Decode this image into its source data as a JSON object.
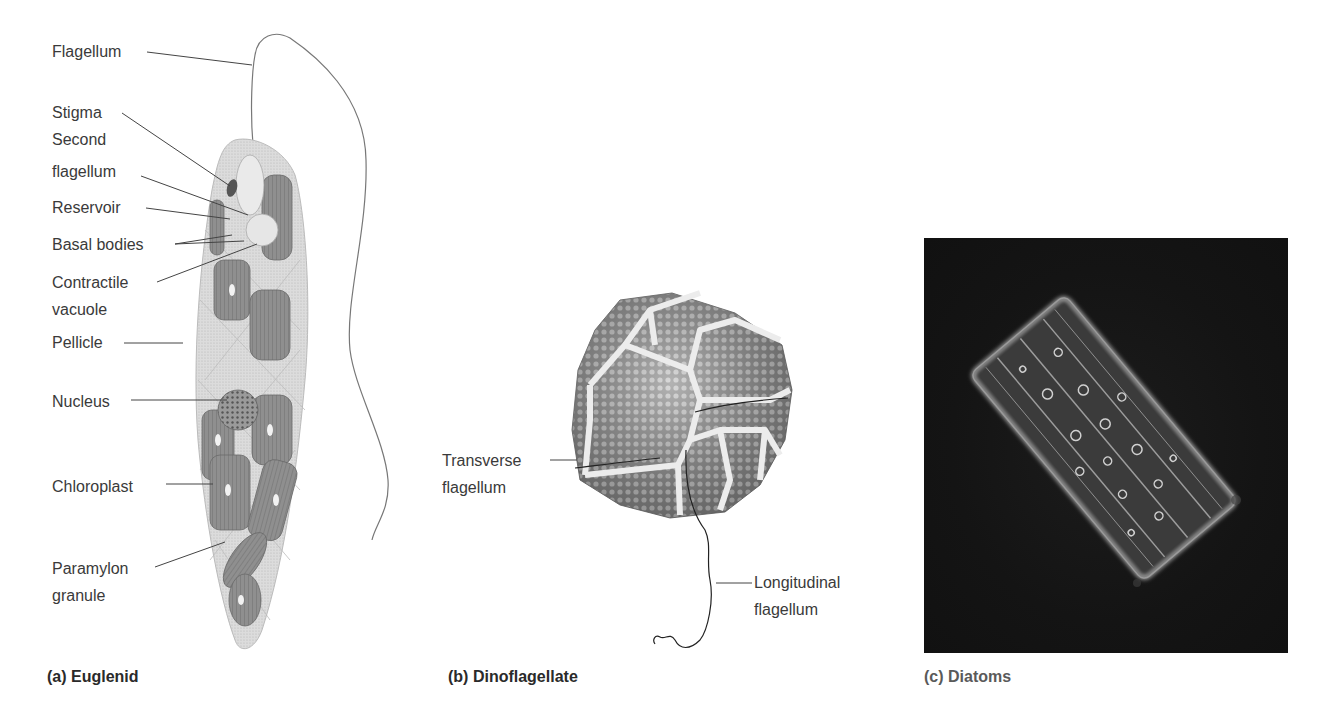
{
  "figure": {
    "panels": [
      {
        "id": "a",
        "caption": "(a) Euglenid",
        "labels": [
          {
            "text": "Flagellum"
          },
          {
            "text": "Stigma"
          },
          {
            "text": "Second flagellum",
            "lines": [
              "Second",
              "flagellum"
            ]
          },
          {
            "text": "Reservoir"
          },
          {
            "text": "Basal bodies"
          },
          {
            "text": "Contractile vacuole",
            "lines": [
              "Contractile",
              "vacuole"
            ]
          },
          {
            "text": "Pellicle"
          },
          {
            "text": "Nucleus"
          },
          {
            "text": "Chloroplast"
          },
          {
            "text": "Paramylon granule",
            "lines": [
              "Paramylon",
              "granule"
            ]
          }
        ]
      },
      {
        "id": "b",
        "caption": "(b) Dinoflagellate",
        "labels": [
          {
            "text": "Transverse flagellum",
            "lines": [
              "Transverse",
              "flagellum"
            ]
          },
          {
            "text": "Longitudinal flagellum",
            "lines": [
              "Longitudinal",
              "flagellum"
            ]
          }
        ]
      },
      {
        "id": "c",
        "caption": "(c) Diatoms",
        "image": "micrograph-diatom"
      }
    ],
    "colors": {
      "background": "#ffffff",
      "text": "#3a3a3a",
      "leader_line": "#444444",
      "cell_fill": "#d9d9d9",
      "chloroplast": "#8c8c8c",
      "photo_bg": "#141414"
    }
  }
}
